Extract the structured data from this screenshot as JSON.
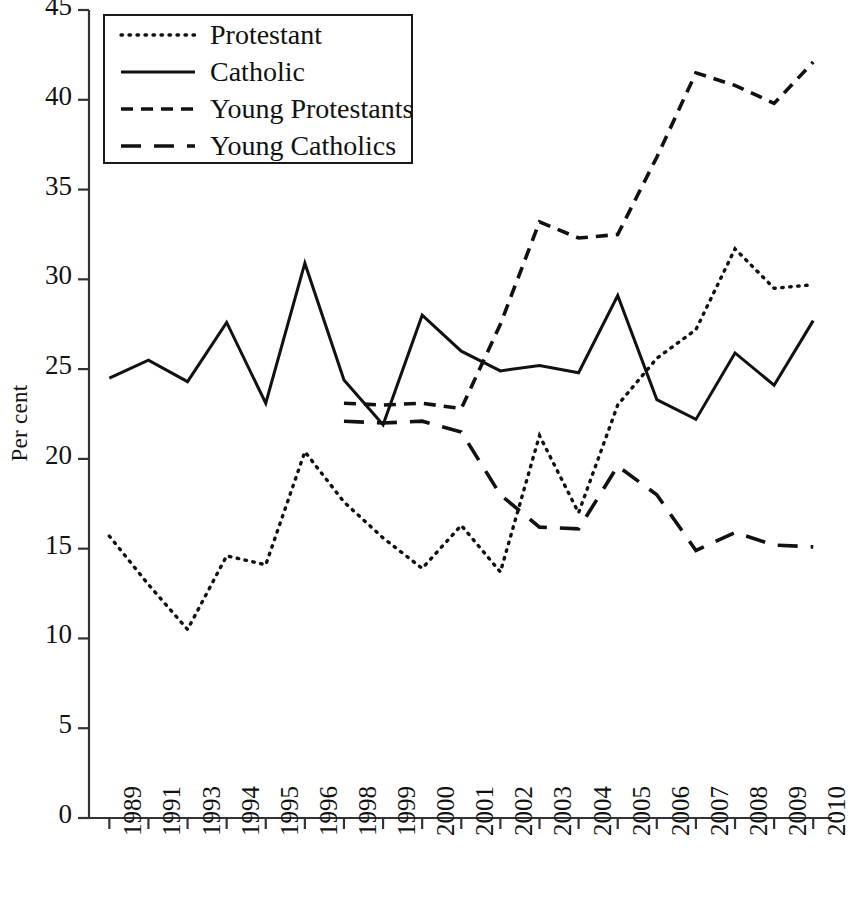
{
  "chart_data": {
    "type": "line",
    "title": "",
    "xlabel": "",
    "ylabel": "Per cent",
    "ylim": [
      0,
      45
    ],
    "ytick_step": 5,
    "grid": false,
    "legend_position": "top-left",
    "categories": [
      "1989",
      "1991",
      "1993",
      "1994",
      "1995",
      "1996",
      "1998",
      "1999",
      "2000",
      "2001",
      "2002",
      "2003",
      "2004",
      "2005",
      "2006",
      "2007",
      "2008",
      "2009",
      "2010"
    ],
    "yticks": [
      "0",
      "5",
      "10",
      "15",
      "20",
      "25",
      "30",
      "35",
      "40",
      "45"
    ],
    "series": [
      {
        "name": "Protestant",
        "style": "dotted",
        "color": "#111111",
        "values": [
          15.7,
          13.0,
          10.5,
          14.6,
          14.1,
          20.4,
          17.6,
          15.6,
          13.9,
          16.3,
          13.7,
          21.3,
          17.0,
          23.0,
          25.6,
          27.2,
          31.7,
          29.5,
          29.7
        ]
      },
      {
        "name": "Catholic",
        "style": "solid",
        "color": "#111111",
        "values": [
          24.5,
          25.5,
          24.3,
          27.6,
          23.1,
          30.9,
          24.4,
          21.9,
          28.0,
          26.0,
          24.9,
          25.2,
          24.8,
          29.1,
          23.3,
          22.2,
          25.9,
          24.1,
          27.7
        ]
      },
      {
        "name": "Young Protestants",
        "style": "dashed-short",
        "color": "#111111",
        "values": [
          null,
          null,
          null,
          null,
          null,
          null,
          23.1,
          23.0,
          23.1,
          22.8,
          27.5,
          33.2,
          32.3,
          32.5,
          36.8,
          41.5,
          40.8,
          39.8,
          42.1
        ]
      },
      {
        "name": "Young Catholics",
        "style": "dashed-long",
        "color": "#111111",
        "values": [
          null,
          null,
          null,
          null,
          null,
          null,
          22.1,
          22.0,
          22.1,
          21.5,
          18.0,
          16.2,
          16.1,
          19.6,
          18.0,
          14.9,
          15.9,
          15.2,
          15.1
        ]
      }
    ]
  },
  "legend": {
    "items": [
      {
        "label": "Protestant",
        "key": "dotted-line-key"
      },
      {
        "label": "Catholic",
        "key": "solid-line-key"
      },
      {
        "label": "Young Protestants",
        "key": "short-dash-line-key"
      },
      {
        "label": "Young Catholics",
        "key": "long-dash-line-key"
      }
    ]
  }
}
